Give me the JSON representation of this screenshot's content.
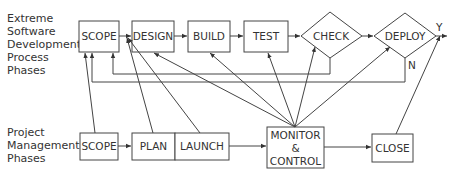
{
  "row_labels": {
    "xp": [
      "Extreme",
      "Software",
      "Development",
      "Process",
      "Phases"
    ],
    "pm": [
      "Project",
      "Management",
      "Phases"
    ]
  },
  "xp_phases": [
    {
      "id": "scope",
      "label": "SCOPE",
      "shape": "rect"
    },
    {
      "id": "design",
      "label": "DESIGN",
      "shape": "rect"
    },
    {
      "id": "build",
      "label": "BUILD",
      "shape": "rect"
    },
    {
      "id": "test",
      "label": "TEST",
      "shape": "rect"
    },
    {
      "id": "check",
      "label": "CHECK",
      "shape": "diamond"
    },
    {
      "id": "deploy",
      "label": "DEPLOY",
      "shape": "diamond"
    }
  ],
  "pm_phases": [
    {
      "id": "scope",
      "label": "SCOPE"
    },
    {
      "id": "plan",
      "label": "PLAN"
    },
    {
      "id": "launch",
      "label": "LAUNCH"
    },
    {
      "id": "monitor",
      "label_lines": [
        "MONITOR",
        "&",
        "CONTROL"
      ]
    },
    {
      "id": "close",
      "label": "CLOSE"
    }
  ],
  "decision_labels": {
    "yes": "Y",
    "no": "N"
  },
  "colors": {
    "stroke": "#444444",
    "text": "#333333",
    "background": "#ffffff"
  }
}
